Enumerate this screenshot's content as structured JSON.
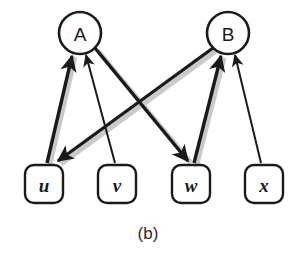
{
  "figure": {
    "caption": "(b)",
    "background_color": "#ffffff",
    "stroke_color": "#1a1a1a",
    "shadow_color": "#c9c9c9"
  },
  "nodes": {
    "circles": [
      {
        "id": "A",
        "label": "A",
        "cx": 80,
        "cy": 33,
        "r": 21
      },
      {
        "id": "B",
        "label": "B",
        "cx": 228,
        "cy": 33,
        "r": 21
      }
    ],
    "boxes": [
      {
        "id": "u",
        "label": "u",
        "x": 25,
        "y": 165,
        "w": 38,
        "h": 38,
        "rx": 9
      },
      {
        "id": "v",
        "label": "v",
        "x": 98,
        "y": 165,
        "w": 38,
        "h": 38,
        "rx": 9
      },
      {
        "id": "w",
        "label": "w",
        "x": 172,
        "y": 165,
        "w": 38,
        "h": 38,
        "rx": 9
      },
      {
        "id": "x",
        "label": "x",
        "x": 245,
        "y": 165,
        "w": 38,
        "h": 38,
        "rx": 9
      }
    ]
  },
  "edges": [
    {
      "id": "u-to-A",
      "from": "u",
      "to": "A",
      "weight": "thick",
      "x1": 47,
      "y1": 163,
      "x2": 72,
      "y2": 56,
      "arrow_at": "to"
    },
    {
      "id": "v-to-A",
      "from": "v",
      "to": "A",
      "weight": "thin",
      "x1": 115,
      "y1": 163,
      "x2": 86,
      "y2": 55,
      "arrow_at": "to"
    },
    {
      "id": "A-to-w",
      "from": "A",
      "to": "w",
      "weight": "thick",
      "x1": 95,
      "y1": 48,
      "x2": 188,
      "y2": 161,
      "arrow_at": "to"
    },
    {
      "id": "B-to-u",
      "from": "B",
      "to": "u",
      "weight": "thick",
      "x1": 213,
      "y1": 48,
      "x2": 58,
      "y2": 161,
      "arrow_at": "to"
    },
    {
      "id": "w-to-B",
      "from": "w",
      "to": "B",
      "weight": "thick",
      "x1": 194,
      "y1": 163,
      "x2": 221,
      "y2": 56,
      "arrow_at": "to"
    },
    {
      "id": "x-to-B",
      "from": "x",
      "to": "B",
      "weight": "thin",
      "x1": 261,
      "y1": 163,
      "x2": 235,
      "y2": 55,
      "arrow_at": "to"
    }
  ]
}
